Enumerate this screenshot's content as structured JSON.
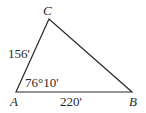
{
  "diagram": {
    "type": "triangle",
    "vertices": {
      "A": {
        "label": "A",
        "x": 16,
        "y": 92
      },
      "B": {
        "label": "B",
        "x": 132,
        "y": 92
      },
      "C": {
        "label": "C",
        "x": 49,
        "y": 19
      }
    },
    "sides": {
      "AC": {
        "label": "156'"
      },
      "AB": {
        "label": "220'"
      }
    },
    "angles": {
      "A": {
        "label": "76°10'"
      }
    },
    "stroke_color": "#2a2a2a"
  }
}
